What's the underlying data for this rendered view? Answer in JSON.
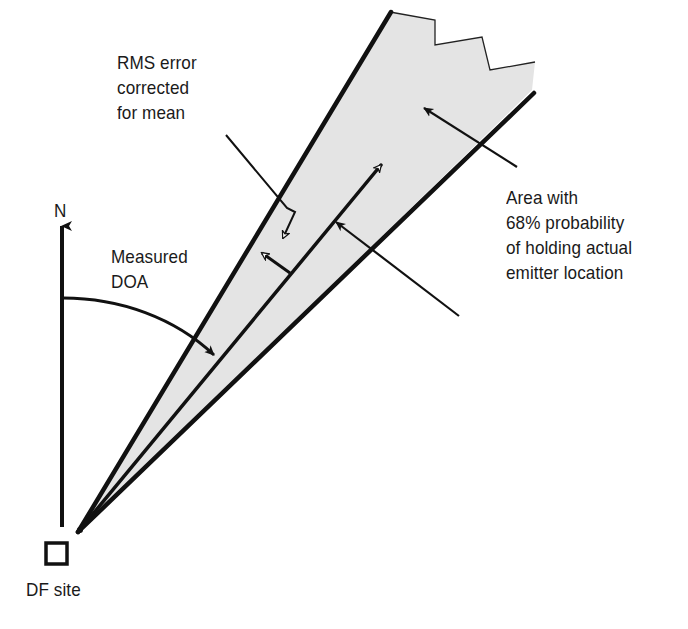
{
  "diagram": {
    "colors": {
      "wedge_fill": "#e4e4e4",
      "line": "#111111",
      "background": "#ffffff"
    },
    "labels": {
      "north": "N",
      "df_site": "DF site",
      "measured_doa": [
        "Measured",
        "DOA"
      ],
      "rms_error": [
        "RMS error",
        "corrected",
        "for mean"
      ],
      "area": [
        "Area with",
        "68% probability",
        "of holding actual",
        "emitter location"
      ]
    },
    "nodes": [
      {
        "id": "df-site",
        "label": "DF site",
        "shape": "square"
      },
      {
        "id": "north-arrow",
        "label": "N",
        "shape": "arrow"
      },
      {
        "id": "measured-doa-line",
        "label": "Measured DOA",
        "shape": "arrow-line"
      },
      {
        "id": "error-wedge",
        "label": "Area with 68% probability of holding actual emitter location",
        "shape": "wedge"
      },
      {
        "id": "rms-error",
        "label": "RMS error corrected for mean",
        "shape": "callout"
      }
    ],
    "edges": [
      {
        "from": "north-arrow",
        "to": "measured-doa-line",
        "label": "Measured DOA",
        "type": "angle-arc"
      },
      {
        "from": "rms-error",
        "to": "error-wedge",
        "type": "leader"
      },
      {
        "from": "area-label",
        "to": "error-wedge",
        "type": "leader"
      }
    ]
  }
}
